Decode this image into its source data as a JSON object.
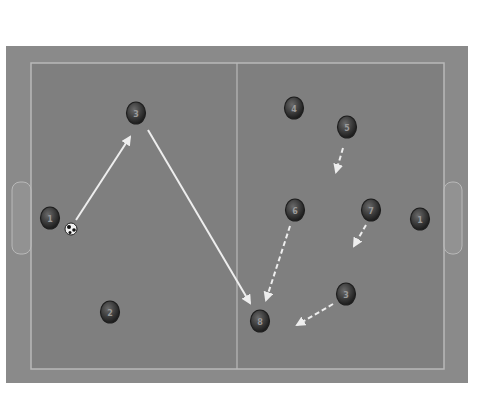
{
  "diagram": {
    "type": "futsal-tactics-board",
    "colors": {
      "background": "#ffffff",
      "outer_field": "#8a8a8a",
      "pitch": "#7f7f7f",
      "lines": "#b9b9b9",
      "goal_area": "#a0a0a0",
      "player_fill": "#3a3a3a",
      "player_rim": "#1e1e1e",
      "arrow": "#eeeeee"
    },
    "field": {
      "outer": {
        "x": 6,
        "y": 46,
        "w": 462,
        "h": 337
      },
      "pitch": {
        "x": 31,
        "y": 63,
        "w": 413,
        "h": 306
      },
      "center_line_x": 237,
      "goals": [
        {
          "side": "left",
          "x": 12,
          "y": 182,
          "w": 19,
          "h": 72
        },
        {
          "side": "right",
          "x": 444,
          "y": 182,
          "w": 18,
          "h": 72
        }
      ]
    },
    "players": [
      {
        "id": "p1",
        "number": "1",
        "x": 50,
        "y": 218
      },
      {
        "id": "p2",
        "number": "3",
        "x": 136,
        "y": 113
      },
      {
        "id": "p3",
        "number": "2",
        "x": 110,
        "y": 312
      },
      {
        "id": "p4",
        "number": "4",
        "x": 294,
        "y": 108
      },
      {
        "id": "p5",
        "number": "5",
        "x": 347,
        "y": 127
      },
      {
        "id": "p6",
        "number": "6",
        "x": 295,
        "y": 210
      },
      {
        "id": "p7",
        "number": "7",
        "x": 371,
        "y": 210
      },
      {
        "id": "p8",
        "number": "1",
        "x": 420,
        "y": 219
      },
      {
        "id": "p9",
        "number": "3",
        "x": 346,
        "y": 294
      },
      {
        "id": "p10",
        "number": "8",
        "x": 260,
        "y": 321
      }
    ],
    "ball": {
      "x": 71,
      "y": 229
    },
    "arrows": [
      {
        "id": "a1",
        "style": "solid",
        "x1": 76,
        "y1": 220,
        "x2": 130,
        "y2": 137
      },
      {
        "id": "a2",
        "style": "solid",
        "x1": 148,
        "y1": 130,
        "x2": 250,
        "y2": 303
      },
      {
        "id": "a3",
        "style": "dashed",
        "x1": 343,
        "y1": 148,
        "x2": 336,
        "y2": 172
      },
      {
        "id": "a4",
        "style": "dashed",
        "x1": 290,
        "y1": 226,
        "x2": 266,
        "y2": 300
      },
      {
        "id": "a5",
        "style": "dashed",
        "x1": 366,
        "y1": 225,
        "x2": 354,
        "y2": 246
      },
      {
        "id": "a6",
        "style": "dashed",
        "x1": 333,
        "y1": 304,
        "x2": 297,
        "y2": 325
      }
    ]
  }
}
